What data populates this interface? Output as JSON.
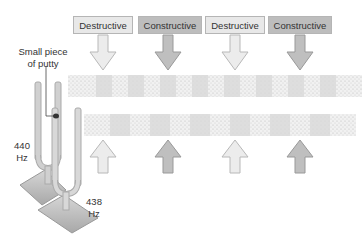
{
  "labels": [
    {
      "text": "Destructive",
      "type": "destructive",
      "x": 73,
      "w": 60
    },
    {
      "text": "Constructive",
      "type": "constructive",
      "x": 138,
      "w": 64
    },
    {
      "text": "Destructive",
      "type": "destructive",
      "x": 205,
      "w": 60
    },
    {
      "text": "Constructive",
      "type": "constructive",
      "x": 268,
      "w": 64
    }
  ],
  "annotations": {
    "putty": "Small piece of putty",
    "fork1_freq": "440",
    "fork1_unit": "Hz",
    "fork2_freq": "438",
    "fork2_unit": "Hz"
  },
  "colors": {
    "destructive_fill": "#e8e8e8",
    "constructive_fill": "#bdbdbd",
    "band_light": "#ececec",
    "band_dark": "#d4d4d4",
    "fork": "#d0d0d0"
  }
}
